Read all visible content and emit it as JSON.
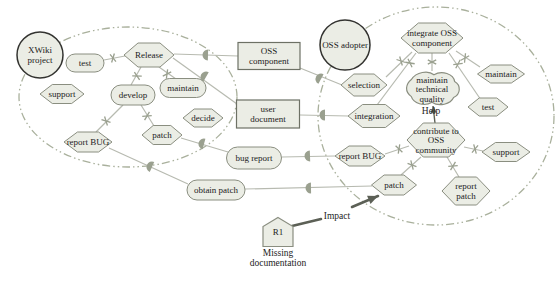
{
  "figure": {
    "type": "istar-strategic-rationale-diagram",
    "caption_r1_line1": "Missing",
    "caption_r1_line2": "documentation",
    "impact_label": "Impact",
    "help_label": "Help"
  },
  "colors": {
    "node_fill": "#ebede5",
    "node_stroke": "#8a8e80",
    "rect_stroke": "#6d7165",
    "actor_stroke": "#333330",
    "line": "#b7bab0",
    "mark": "#9aa08f",
    "boundary": "#a9b09c",
    "text": "#1c1c1c",
    "impact": "#5c6056"
  },
  "boundaries": [
    {
      "name": "xwiki-project-boundary",
      "cx": 128,
      "cy": 97,
      "rx": 109,
      "ry": 70
    },
    {
      "name": "oss-adopter-boundary",
      "cx": 436,
      "cy": 116,
      "rx": 118,
      "ry": 109
    }
  ],
  "nodes": [
    {
      "id": "xwiki-project",
      "shape": "circle",
      "label": "XWiki\nproject",
      "x": 40,
      "y": 55,
      "w": 46,
      "h": 46
    },
    {
      "id": "test-left",
      "shape": "stadium",
      "label": "test",
      "x": 85,
      "y": 63,
      "w": 38,
      "h": 18
    },
    {
      "id": "release",
      "shape": "hex",
      "label": "Release",
      "x": 149,
      "y": 55,
      "w": 50,
      "h": 24
    },
    {
      "id": "support-left",
      "shape": "hex",
      "label": "support",
      "x": 62,
      "y": 94,
      "w": 44,
      "h": 19
    },
    {
      "id": "develop",
      "shape": "stadium",
      "label": "develop",
      "x": 133,
      "y": 95,
      "w": 44,
      "h": 20
    },
    {
      "id": "maintain-left",
      "shape": "stadium",
      "label": "maintain",
      "x": 183,
      "y": 88,
      "w": 46,
      "h": 19
    },
    {
      "id": "decide",
      "shape": "hex",
      "label": "decide",
      "x": 203,
      "y": 118,
      "w": 40,
      "h": 18
    },
    {
      "id": "patch-left",
      "shape": "hex",
      "label": "patch",
      "x": 162,
      "y": 135,
      "w": 40,
      "h": 19
    },
    {
      "id": "report-bug-left",
      "shape": "hex",
      "label": "report BUG",
      "x": 88,
      "y": 142,
      "w": 48,
      "h": 20
    },
    {
      "id": "oss-component",
      "shape": "rect",
      "label": "OSS\ncomponent",
      "x": 269,
      "y": 56,
      "w": 62,
      "h": 27
    },
    {
      "id": "user-document",
      "shape": "rect",
      "label": "user\ndocument",
      "x": 268,
      "y": 114,
      "w": 63,
      "h": 28
    },
    {
      "id": "bug-report",
      "shape": "stadium",
      "label": "bug report",
      "x": 254,
      "y": 158,
      "w": 55,
      "h": 22
    },
    {
      "id": "obtain-patch",
      "shape": "stadium",
      "label": "obtain patch",
      "x": 216,
      "y": 190,
      "w": 58,
      "h": 20
    },
    {
      "id": "oss-adopter",
      "shape": "circle",
      "label": "OSS adopter",
      "x": 345,
      "y": 45,
      "w": 50,
      "h": 50
    },
    {
      "id": "selection",
      "shape": "hex",
      "label": "selection",
      "x": 364,
      "y": 85,
      "w": 46,
      "h": 22
    },
    {
      "id": "integration",
      "shape": "hex",
      "label": "integration",
      "x": 374,
      "y": 116,
      "w": 52,
      "h": 23
    },
    {
      "id": "integrate-oss-component",
      "shape": "hex",
      "label": "integrate OSS\ncomponent",
      "x": 432,
      "y": 38,
      "w": 62,
      "h": 30
    },
    {
      "id": "maintain-technical-quality",
      "shape": "cloud",
      "label": "maintain\ntechnical\nquality",
      "x": 432,
      "y": 89,
      "w": 56,
      "h": 37
    },
    {
      "id": "maintain-right",
      "shape": "hex",
      "label": "maintain",
      "x": 501,
      "y": 74,
      "w": 47,
      "h": 18
    },
    {
      "id": "test-right",
      "shape": "hex",
      "label": "test",
      "x": 488,
      "y": 107,
      "w": 40,
      "h": 18
    },
    {
      "id": "contribute-to-oss-community",
      "shape": "hex",
      "label": "contribute to\nOSS\ncommunity",
      "x": 436,
      "y": 140,
      "w": 58,
      "h": 34
    },
    {
      "id": "support-right",
      "shape": "hex",
      "label": "support",
      "x": 506,
      "y": 152,
      "w": 48,
      "h": 19
    },
    {
      "id": "report-bug-right",
      "shape": "hex",
      "label": "report BUG",
      "x": 360,
      "y": 156,
      "w": 50,
      "h": 20
    },
    {
      "id": "patch-right",
      "shape": "hex",
      "label": "patch",
      "x": 394,
      "y": 185,
      "w": 45,
      "h": 20
    },
    {
      "id": "report-patch",
      "shape": "hex",
      "label": "report\npatch",
      "x": 466,
      "y": 191,
      "w": 48,
      "h": 28
    },
    {
      "id": "r1-belief",
      "shape": "pentagon",
      "label": "R1",
      "x": 278,
      "y": 232,
      "w": 30,
      "h": 29
    }
  ],
  "decomposition_links": [
    {
      "from": [
        104,
        60
      ],
      "to": [
        125,
        56
      ],
      "mark": [
        113,
        58
      ]
    },
    {
      "from": [
        141,
        67
      ],
      "to": [
        131,
        85
      ],
      "mark": [
        137,
        76
      ]
    },
    {
      "from": [
        159,
        67
      ],
      "to": [
        176,
        79
      ],
      "mark": [
        167,
        74
      ]
    },
    {
      "from": [
        123,
        105
      ],
      "to": [
        96,
        132
      ],
      "mark": [
        106,
        121
      ]
    },
    {
      "from": [
        141,
        105
      ],
      "to": [
        154,
        126
      ],
      "mark": [
        147,
        116
      ]
    },
    {
      "from": [
        412,
        52
      ],
      "to": [
        386,
        77
      ],
      "mark": [
        401,
        61
      ]
    },
    {
      "from": [
        416,
        53
      ],
      "to": [
        377,
        105
      ],
      "mark": [
        410,
        63
      ]
    },
    {
      "from": [
        432,
        53
      ],
      "to": [
        432,
        71
      ],
      "mark": [
        432,
        62
      ]
    },
    {
      "from": [
        449,
        53
      ],
      "to": [
        481,
        100
      ],
      "mark": [
        458,
        64
      ]
    },
    {
      "from": [
        456,
        51
      ],
      "to": [
        480,
        67
      ],
      "mark": [
        465,
        58
      ]
    },
    {
      "from": [
        409,
        146
      ],
      "to": [
        385,
        154
      ],
      "mark": [
        399,
        149
      ]
    },
    {
      "from": [
        464,
        147
      ],
      "to": [
        483,
        151
      ],
      "mark": [
        475,
        149
      ]
    },
    {
      "from": [
        421,
        157
      ],
      "to": [
        401,
        175
      ],
      "mark": [
        412,
        165
      ]
    },
    {
      "from": [
        447,
        157
      ],
      "to": [
        459,
        177
      ],
      "mark": [
        453,
        166
      ]
    }
  ],
  "dependency_links": [
    {
      "from": [
        174,
        54
      ],
      "to": [
        238,
        56
      ],
      "marker": [
        208,
        55
      ]
    },
    {
      "from": [
        300,
        68
      ],
      "to": [
        342,
        85
      ],
      "marker": [
        321,
        79
      ]
    },
    {
      "from": [
        173,
        58
      ],
      "to": [
        237,
        104
      ],
      "marker": [
        206,
        77
      ]
    },
    {
      "from": [
        300,
        115
      ],
      "to": [
        348,
        116
      ],
      "marker": [
        325,
        115
      ]
    },
    {
      "from": [
        181,
        138
      ],
      "to": [
        228,
        152
      ],
      "marker": [
        204,
        144
      ]
    },
    {
      "from": [
        282,
        157
      ],
      "to": [
        335,
        156
      ],
      "marker": [
        310,
        156
      ]
    },
    {
      "from": [
        109,
        148
      ],
      "to": [
        188,
        184
      ],
      "marker": [
        152,
        167
      ]
    },
    {
      "from": [
        245,
        189
      ],
      "to": [
        372,
        186
      ],
      "marker": [
        311,
        188
      ]
    }
  ],
  "help_link": {
    "from": [
      435,
      123
    ],
    "to": [
      433,
      106
    ],
    "label_pos": [
      431,
      114
    ]
  },
  "impact": {
    "segment": [
      [
        292,
        226
      ],
      [
        321,
        219
      ]
    ],
    "arrow": [
      [
        352,
        207
      ],
      [
        378,
        196
      ]
    ],
    "label_pos": [
      337,
      219
    ]
  },
  "r1_caption": {
    "pos": [
      278,
      256
    ],
    "line_height": 10
  }
}
